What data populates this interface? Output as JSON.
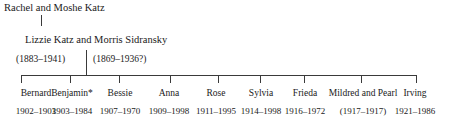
{
  "diagram": {
    "type": "family-tree",
    "generation1": {
      "names": "Rachel and Moshe Katz"
    },
    "generation2": {
      "names": "Lizzie Katz and Morris Sidransky",
      "date_left": "(1883–1941)",
      "date_right": "(1869–1936?)"
    },
    "children": [
      {
        "name": "Bernard",
        "dates": "1902–1903",
        "x": 21,
        "label_x": 36
      },
      {
        "name": "Benjamin*",
        "dates": "1903–1984",
        "x": 70,
        "label_x": 72
      },
      {
        "name": "Bessie",
        "dates": "1907–1970",
        "x": 119,
        "label_x": 120
      },
      {
        "name": "Anna",
        "dates": "1909–1998",
        "x": 170,
        "label_x": 169
      },
      {
        "name": "Rose",
        "dates": "1911–1995",
        "x": 218,
        "label_x": 216
      },
      {
        "name": "Sylvia",
        "dates": "1914–1998",
        "x": 260,
        "label_x": 261
      },
      {
        "name": "Frieda",
        "dates": "1916–1972",
        "x": 304,
        "label_x": 305
      },
      {
        "name": "Mildred and Pearl",
        "dates": "(1917–1917)",
        "x": 361,
        "label_x": 363
      },
      {
        "name": "Irving",
        "dates": "1921–1986",
        "x": 416,
        "label_x": 415
      }
    ]
  }
}
